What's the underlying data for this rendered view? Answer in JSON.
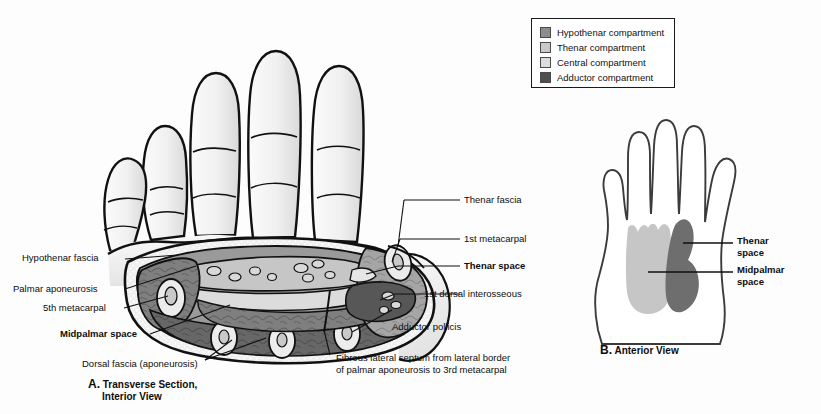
{
  "figure": {
    "background_color": "#fdfdfd"
  },
  "legend": {
    "border_color": "#1a1a1a",
    "items": [
      {
        "label": "Hypothenar compartment",
        "color": "#8d8d8d"
      },
      {
        "label": "Thenar compartment",
        "color": "#c9c9c9"
      },
      {
        "label": "Central compartment",
        "color": "#dcdcdc"
      },
      {
        "label": "Adductor compartment",
        "color": "#4f4f4f"
      }
    ]
  },
  "panel_a": {
    "caption_letter": "A.",
    "caption_line1": "Transverse Section,",
    "caption_line2": "Interior View",
    "labels": {
      "hypothenar_fascia": "Hypothenar fascia",
      "palmar_aponeurosis": "Palmar aponeurosis",
      "fifth_metacarpal": "5th metacarpal",
      "midpalmar_space": "Midpalmar space",
      "dorsal_fascia": "Dorsal fascia (aponeurosis)",
      "fibrous_septum_line1": "Fibrous lateral septum from lateral border",
      "fibrous_septum_line2": "of palmar aponeurosis to 3rd metacarpal",
      "thenar_fascia": "Thenar fascia",
      "first_metacarpal": "1st metacarpal",
      "thenar_space": "Thenar space",
      "first_dorsal_interosseous": "1st dorsal interosseous",
      "adductor_pollicis": "Adductor pollicis"
    }
  },
  "panel_b": {
    "caption_letter": "B.",
    "caption_text": "Anterior View",
    "labels": {
      "thenar_space_line1": "Thenar",
      "thenar_space_line2": "space",
      "midpalmar_space_line1": "Midpalmar",
      "midpalmar_space_line2": "space"
    },
    "regions": {
      "thenar_space_color": "#6e6e6e",
      "midpalmar_space_color": "#c6c6c6"
    }
  },
  "colors": {
    "outline": "#111111",
    "skin": "#f4f4f4",
    "skin_shadow": "#e2e2e2",
    "muscle_dark": "#6e6e6e",
    "muscle_mid": "#8d8d8d",
    "muscle_light": "#b5b5b5",
    "central_space": "#d2d2d2",
    "adductor": "#4f4f4f",
    "bone": "#ececec",
    "fat_dots": "#e8e8e8"
  }
}
